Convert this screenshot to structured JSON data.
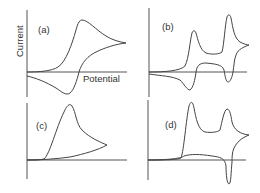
{
  "figure": {
    "axis_labels": {
      "y": "Current",
      "x": "Potential"
    },
    "panels": [
      {
        "id": "a",
        "label": "(a)",
        "description": "Reversible single-electron cyclic voltammogram"
      },
      {
        "id": "b",
        "label": "(b)",
        "description": "Two sequential reversible redox waves"
      },
      {
        "id": "c",
        "label": "(c)",
        "description": "Irreversible oxidation, no return peak"
      },
      {
        "id": "d",
        "label": "(d)",
        "description": "Two oxidation waves, single reduction peak"
      }
    ],
    "colors": {
      "line": "#444444",
      "axis": "#555555",
      "background": "#ffffff"
    }
  }
}
